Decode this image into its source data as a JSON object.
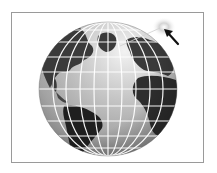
{
  "figure": {
    "icons": {
      "globe": "globe-icon",
      "arrow": "arrow-pointer-icon",
      "light": "light-glow-icon"
    },
    "colors": {
      "frame": "#9a9a9a",
      "ocean_light": "#d8d8d8",
      "ocean_mid": "#a8a8a8",
      "ocean_dark": "#6e6e6e",
      "land": "#3a3a3a",
      "land_dark": "#1c1c1c",
      "grid": "#ffffff",
      "arrow": "#111111",
      "glow": "#cfcfcf"
    },
    "globe": {
      "cx": 108,
      "cy": 89,
      "rx": 69,
      "ry": 67
    }
  }
}
